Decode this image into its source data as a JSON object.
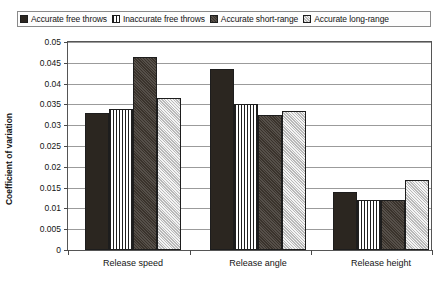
{
  "chart_data": {
    "type": "bar",
    "title": "",
    "xlabel": "",
    "ylabel": "Coefficient of variation",
    "categories": [
      "Release speed",
      "Release angle",
      "Release height"
    ],
    "ylim": [
      0,
      0.05
    ],
    "ytick_labels": [
      "0.05",
      "0.045",
      "0.04",
      "0.035",
      "0.03",
      "0.025",
      "0.02",
      "0.015",
      "0.01",
      "0.005",
      "0"
    ],
    "ytick_values": [
      0.05,
      0.045,
      0.04,
      0.035,
      0.03,
      0.025,
      0.02,
      0.015,
      0.01,
      0.005,
      0
    ],
    "grid": true,
    "legend_position": "top",
    "series": [
      {
        "name": "Accurate free throws",
        "fill": "solid-black",
        "values": [
          0.033,
          0.0435,
          0.014
        ]
      },
      {
        "name": "Inaccurate free throws",
        "fill": "vstripe",
        "values": [
          0.034,
          0.035,
          0.012
        ]
      },
      {
        "name": "Accurate short-range",
        "fill": "dark-speckle",
        "values": [
          0.0465,
          0.0325,
          0.012
        ]
      },
      {
        "name": "Accurate long-range",
        "fill": "light-check",
        "values": [
          0.0365,
          0.0335,
          0.0168
        ]
      }
    ]
  }
}
